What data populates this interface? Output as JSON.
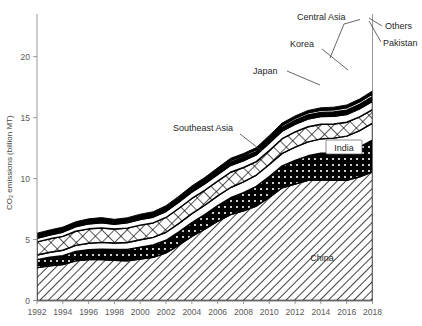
{
  "chart_data": {
    "type": "area",
    "title": "",
    "xlabel": "",
    "ylabel": "CO2 emissions (billion MT)",
    "ylabel_display": "CO₂ emissions (billion MT)",
    "xlim": [
      1992,
      2018
    ],
    "ylim": [
      0,
      23.5
    ],
    "yticks": [
      0,
      5,
      10,
      15,
      20
    ],
    "ytick_labels": [
      "0",
      "5",
      "10",
      "15",
      "20"
    ],
    "xticks": [
      1992,
      1994,
      1996,
      1998,
      2000,
      2002,
      2004,
      2006,
      2008,
      2010,
      2012,
      2014,
      2016,
      2018
    ],
    "xtick_labels": [
      "1992",
      "1994",
      "1996",
      "1998",
      "2000",
      "2002",
      "2004",
      "2006",
      "2008",
      "2010",
      "2012",
      "2014",
      "2016",
      "2018"
    ],
    "grid": false,
    "stacked": true,
    "legend": "inline-annotations",
    "x": [
      1992,
      1993,
      1994,
      1995,
      1996,
      1997,
      1998,
      1999,
      2000,
      2001,
      2002,
      2003,
      2004,
      2005,
      2006,
      2007,
      2008,
      2009,
      2010,
      2011,
      2012,
      2013,
      2014,
      2015,
      2016,
      2017,
      2018
    ],
    "series": [
      {
        "name": "China",
        "pattern": "diagonal-hatch",
        "values": [
          2.7,
          2.85,
          2.95,
          3.25,
          3.35,
          3.35,
          3.3,
          3.25,
          3.4,
          3.55,
          3.9,
          4.55,
          5.25,
          5.85,
          6.5,
          7.05,
          7.35,
          7.75,
          8.45,
          9.25,
          9.55,
          9.85,
          9.9,
          9.85,
          9.85,
          10.15,
          10.55
        ]
      },
      {
        "name": "India",
        "pattern": "dot-on-black",
        "values": [
          0.65,
          0.7,
          0.72,
          0.78,
          0.82,
          0.86,
          0.88,
          0.94,
          0.98,
          1.0,
          1.04,
          1.08,
          1.14,
          1.2,
          1.28,
          1.38,
          1.5,
          1.62,
          1.72,
          1.8,
          1.95,
          2.02,
          2.18,
          2.25,
          2.35,
          2.45,
          2.6
        ]
      },
      {
        "name": "Southeast Asia",
        "pattern": "white",
        "values": [
          0.38,
          0.41,
          0.45,
          0.49,
          0.53,
          0.56,
          0.54,
          0.57,
          0.6,
          0.63,
          0.66,
          0.7,
          0.74,
          0.76,
          0.8,
          0.84,
          0.88,
          0.92,
          0.98,
          1.02,
          1.08,
          1.14,
          1.18,
          1.22,
          1.28,
          1.34,
          1.4
        ]
      },
      {
        "name": "Japan",
        "pattern": "cross-hatch",
        "values": [
          1.08,
          1.1,
          1.14,
          1.16,
          1.18,
          1.18,
          1.14,
          1.18,
          1.2,
          1.18,
          1.21,
          1.24,
          1.24,
          1.23,
          1.21,
          1.25,
          1.18,
          1.1,
          1.16,
          1.2,
          1.25,
          1.24,
          1.2,
          1.16,
          1.14,
          1.12,
          1.1
        ]
      },
      {
        "name": "Korea",
        "pattern": "white",
        "values": [
          0.28,
          0.31,
          0.34,
          0.37,
          0.4,
          0.43,
          0.39,
          0.43,
          0.46,
          0.47,
          0.49,
          0.5,
          0.51,
          0.52,
          0.53,
          0.55,
          0.55,
          0.55,
          0.59,
          0.62,
          0.62,
          0.63,
          0.62,
          0.62,
          0.63,
          0.65,
          0.68
        ]
      },
      {
        "name": "Central Asia",
        "pattern": "solid-black",
        "values": [
          0.26,
          0.25,
          0.23,
          0.22,
          0.21,
          0.21,
          0.2,
          0.2,
          0.21,
          0.22,
          0.23,
          0.24,
          0.25,
          0.26,
          0.27,
          0.28,
          0.29,
          0.28,
          0.3,
          0.32,
          0.33,
          0.34,
          0.35,
          0.36,
          0.37,
          0.38,
          0.4
        ]
      },
      {
        "name": "Pakistan",
        "pattern": "white-thin",
        "values": [
          0.07,
          0.07,
          0.08,
          0.08,
          0.09,
          0.09,
          0.09,
          0.1,
          0.1,
          0.1,
          0.11,
          0.11,
          0.12,
          0.12,
          0.13,
          0.14,
          0.14,
          0.15,
          0.15,
          0.16,
          0.16,
          0.17,
          0.17,
          0.18,
          0.19,
          0.2,
          0.21
        ]
      },
      {
        "name": "Others",
        "pattern": "solid-black-thin",
        "values": [
          0.1,
          0.1,
          0.11,
          0.11,
          0.12,
          0.12,
          0.12,
          0.12,
          0.13,
          0.13,
          0.14,
          0.14,
          0.15,
          0.15,
          0.16,
          0.17,
          0.17,
          0.17,
          0.18,
          0.19,
          0.2,
          0.2,
          0.21,
          0.22,
          0.23,
          0.24,
          0.25
        ]
      }
    ],
    "annotations": [
      {
        "name": "China",
        "label": "China",
        "style": "plain"
      },
      {
        "name": "India",
        "label": "India",
        "style": "boxed"
      },
      {
        "name": "Southeast Asia",
        "label": "Southeast Asia",
        "style": "leader"
      },
      {
        "name": "Japan",
        "label": "Japan",
        "style": "leader"
      },
      {
        "name": "Korea",
        "label": "Korea",
        "style": "leader"
      },
      {
        "name": "Central Asia",
        "label": "Central Asia",
        "style": "leader"
      },
      {
        "name": "Others",
        "label": "Others",
        "style": "leader"
      },
      {
        "name": "Pakistan",
        "label": "Pakistan",
        "style": "leader"
      }
    ],
    "colors": {
      "ink": "#000000",
      "axis": "#808080",
      "text": "#595959",
      "background": "#ffffff"
    }
  }
}
